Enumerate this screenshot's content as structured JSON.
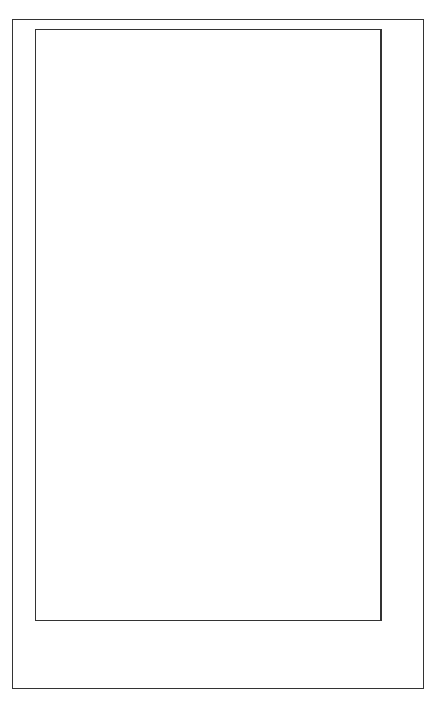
{
  "chart_data": {
    "type": "bar",
    "orientation": "horizontal (image rotated 90°)",
    "title": "",
    "xlabel": "",
    "ylabel": "mm",
    "ylim": [
      0,
      100
    ],
    "yticks": [
      "0",
      "10",
      "20",
      "30",
      "40",
      "50",
      "60",
      "70",
      "80",
      "90",
      "100"
    ],
    "grid": true,
    "legend": null,
    "categories": [
      "Jan",
      "Feb",
      "Mar",
      "Apr",
      "May",
      "Jun",
      "Jul",
      "Aug",
      "Sep",
      "Oct",
      "Nov",
      "Dec"
    ],
    "values": [
      4.5,
      28,
      38.5,
      36,
      90.5,
      65,
      47,
      84,
      57,
      21,
      0.3,
      1
    ]
  },
  "colors": {
    "bar_fill": "#aaaaaa",
    "bar_edge": "#333333",
    "grid": "#999999"
  }
}
